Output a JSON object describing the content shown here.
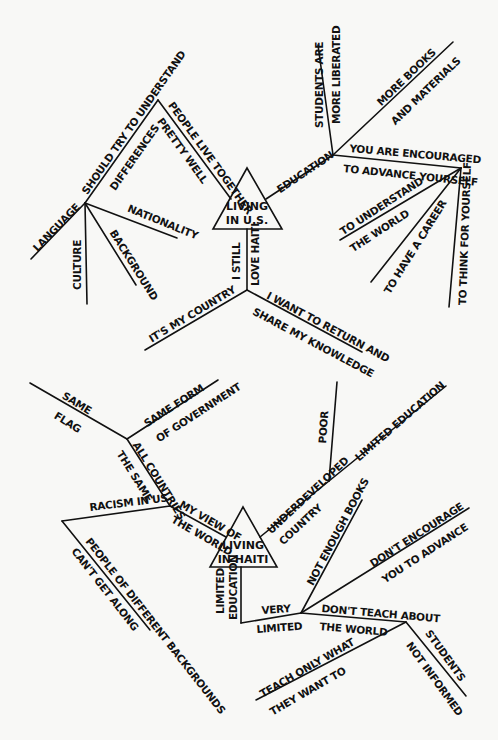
{
  "header": {
    "fragment": "…"
  },
  "us_map": {
    "center": "LIVING\nIN U.S.",
    "center_line1": "LIVING",
    "center_line2": "IN U.S.",
    "labels": {
      "people_live_together": "PEOPLE LIVE TOGETHER",
      "pretty_well": "PRETTY WELL",
      "should_try": "SHOULD TRY TO UNDERSTAND",
      "differences": "DIFFERENCES",
      "language": "LANGUAGE",
      "culture": "CULTURE",
      "background": "BACKGROUND",
      "nationality": "NATIONALITY",
      "education": "EDUCATION",
      "students_are": "STUDENTS ARE",
      "more_liberated": "MORE LIBERATED",
      "more_books": "MORE BOOKS",
      "and_materials": "AND MATERIALS",
      "you_are_encouraged": "YOU ARE ENCOURAGED",
      "to_advance_yourself": "TO ADVANCE YOURSELF",
      "to_understand": "TO UNDERSTAND",
      "the_world": "THE WORLD",
      "to_have_a_career": "TO HAVE A CAREER",
      "to_think_for_yourself": "TO THINK FOR YOURSELF",
      "i_still": "I STILL",
      "love_haiti": "LOVE HAITI",
      "its_my_country": "IT'S MY COUNTRY",
      "i_want_to_return": "I WANT TO RETURN AND",
      "share_my_knowledge": "SHARE MY KNOWLEDGE"
    }
  },
  "haiti_map": {
    "center_line1": "LIVING",
    "center_line2": "IN HAITI",
    "labels": {
      "same": "SAME",
      "flag": "FLAG",
      "same_form": "SAME FORM",
      "of_government": "OF GOVERNMENT",
      "all_countries": "ALL COUNTRIES",
      "the_same": "THE SAME",
      "racism_in_us": "RACISM IN US",
      "my_view_of": "MY VIEW OF",
      "the_world": "THE WORLD",
      "people_of_different": "PEOPLE OF DIFFERENT BACKGROUNDS",
      "cant_get_along": "CAN'T GET ALONG",
      "underdeveloped": "UNDERDEVELOPED",
      "country": "COUNTRY",
      "poor": "POOR",
      "limited_education_branch": "LIMITED EDUCATION",
      "limited": "LIMITED",
      "education": "EDUCATION",
      "very": "VERY",
      "limited2": "LIMITED",
      "not_enough_books": "NOT ENOUGH BOOKS",
      "dont_encourage": "DON'T ENCOURAGE",
      "you_to_advance": "YOU TO ADVANCE",
      "dont_teach_about": "DON'T TEACH ABOUT",
      "the_world2": "THE WORLD",
      "teach_only_what": "TEACH ONLY WHAT",
      "they_want_to": "THEY WANT TO",
      "students": "STUDENTS",
      "not_informed": "NOT INFORMED"
    }
  },
  "colors": {
    "ink": "#111111",
    "paper": "#f8f8f6"
  }
}
